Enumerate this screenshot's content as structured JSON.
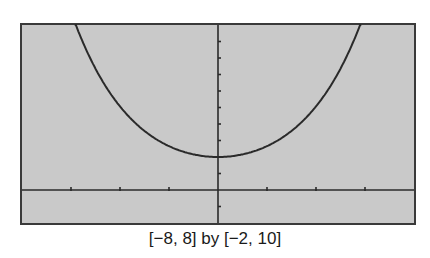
{
  "caption": "[−8, 8] by [−2, 10]",
  "chart_data": {
    "type": "line",
    "title": "",
    "xlabel": "",
    "ylabel": "",
    "window": {
      "xmin": -8,
      "xmax": 8,
      "ymin": -2,
      "ymax": 10,
      "xscl": 2,
      "yscl": 1
    },
    "xlim": [
      -8,
      8
    ],
    "ylim": [
      -2,
      10
    ],
    "grid": false,
    "legend": null,
    "series": [
      {
        "name": "y = f(x) (U-shaped, min ≈ 2 at x = 0)",
        "x": [
          -5.8,
          -5,
          -4,
          -3,
          -2,
          -1,
          0,
          1,
          2,
          3,
          4,
          5,
          5.8
        ],
        "y": [
          10,
          7.2,
          5.0,
          3.6,
          2.6,
          2.15,
          2.0,
          2.15,
          2.6,
          3.6,
          5.0,
          7.2,
          10
        ]
      }
    ],
    "annotations": [
      "[−8, 8] by [−2, 10]"
    ]
  },
  "colors": {
    "screen": "#c9c9c9",
    "ink": "#2a2a2a",
    "frame": "#3a3a3a"
  }
}
